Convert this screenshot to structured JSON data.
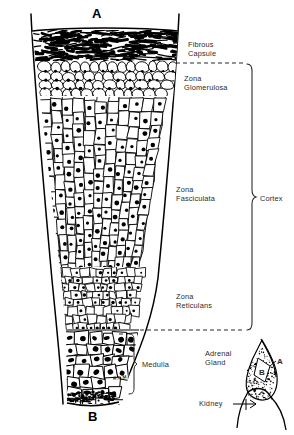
{
  "figure": {
    "title_markers": {
      "top_marker": "A",
      "bottom_marker": "B",
      "artist_signature": "R.L.M."
    },
    "colors": {
      "ink": "#000000",
      "paper": "#ffffff",
      "label_text": "#2b2b2b"
    }
  },
  "labels": {
    "fibrous_capsule": "Fibrous\nCapsule",
    "zona_glomerulosa": "Zona\nGlomerulosa",
    "zona_fasciculata": "Zona\nFasciculata",
    "zona_reticularis": "Zona\nReticulans",
    "cortex": "Cortex",
    "medulla": "Medulla",
    "adrenal_gland": "Adrenal\nGland",
    "kidney": "Kidney"
  },
  "inset": {
    "marker_a": "A",
    "marker_b": "B",
    "gland_label": "Adrenal\nGland",
    "kidney_label": "Kidney"
  },
  "layers": [
    {
      "name": "fibrous-capsule",
      "label": "Fibrous Capsule",
      "y_top": 30,
      "y_bottom": 62
    },
    {
      "name": "zona-glomerulosa",
      "label": "Zona Glomerulosa",
      "y_top": 62,
      "y_bottom": 97
    },
    {
      "name": "zona-fasciculata",
      "label": "Zona Fasciculata",
      "y_top": 97,
      "y_bottom": 268
    },
    {
      "name": "zona-reticularis",
      "label": "Zona Reticulans",
      "y_top": 268,
      "y_bottom": 330
    },
    {
      "name": "medulla",
      "label": "Medulla",
      "y_top": 330,
      "y_bottom": 404
    }
  ]
}
